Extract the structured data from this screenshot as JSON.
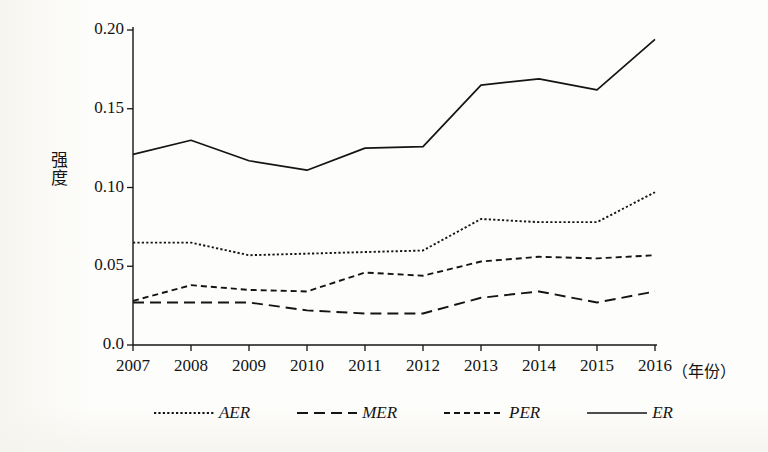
{
  "chart_data": {
    "type": "line",
    "title": "",
    "xlabel": "（年份）",
    "ylabel": "强度",
    "x": [
      2007,
      2008,
      2009,
      2010,
      2011,
      2012,
      2013,
      2014,
      2015,
      2016
    ],
    "categories": [
      "2007",
      "2008",
      "2009",
      "2010",
      "2011",
      "2012",
      "2013",
      "2014",
      "2015",
      "2016"
    ],
    "xlim": [
      2007,
      2016
    ],
    "ylim": [
      0.0,
      0.2
    ],
    "yticks": [
      0.0,
      0.05,
      0.1,
      0.15,
      0.2
    ],
    "ytick_labels": [
      "0.0",
      "0.05",
      "0.10",
      "0.15",
      "0.20"
    ],
    "xtick_labels": [
      "2007",
      "2008",
      "2009",
      "2010",
      "2011",
      "2012",
      "2013",
      "2014",
      "2015",
      "2016"
    ],
    "grid": false,
    "legend_position": "bottom",
    "line_color": "#141414",
    "series": [
      {
        "name": "AER",
        "dash": "dotted",
        "values": [
          0.065,
          0.065,
          0.057,
          0.058,
          0.059,
          0.06,
          0.08,
          0.078,
          0.078,
          0.097
        ]
      },
      {
        "name": "MER",
        "dash": "long-dash",
        "values": [
          0.027,
          0.027,
          0.027,
          0.022,
          0.02,
          0.02,
          0.03,
          0.034,
          0.027,
          0.034
        ]
      },
      {
        "name": "PER",
        "dash": "dash",
        "values": [
          0.028,
          0.038,
          0.035,
          0.034,
          0.046,
          0.044,
          0.053,
          0.056,
          0.055,
          0.057
        ]
      },
      {
        "name": "ER",
        "dash": "solid",
        "values": [
          0.121,
          0.13,
          0.117,
          0.111,
          0.125,
          0.126,
          0.165,
          0.169,
          0.162,
          0.194
        ]
      }
    ]
  },
  "axis": {
    "y_title": "强度",
    "y_title_chars": [
      "强",
      "度"
    ],
    "x_title": "（年份）"
  },
  "legend": {
    "items": [
      {
        "label": "AER"
      },
      {
        "label": "MER"
      },
      {
        "label": "PER"
      },
      {
        "label": "ER"
      }
    ]
  }
}
